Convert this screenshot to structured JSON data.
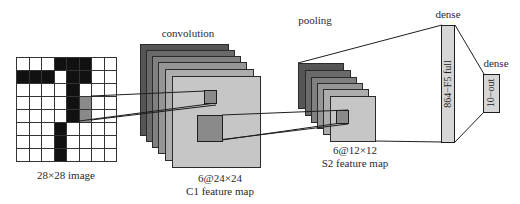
{
  "diagram": {
    "type": "CNN architecture",
    "input": {
      "label": "28×28 image",
      "grid": {
        "rows": 8,
        "cols": 8
      },
      "black_cells": [
        [
          0,
          3
        ],
        [
          0,
          4
        ],
        [
          0,
          5
        ],
        [
          1,
          0
        ],
        [
          1,
          1
        ],
        [
          1,
          2
        ],
        [
          1,
          4
        ],
        [
          1,
          5
        ],
        [
          2,
          4
        ],
        [
          3,
          4
        ],
        [
          4,
          4
        ],
        [
          5,
          3
        ],
        [
          6,
          3
        ],
        [
          7,
          3
        ]
      ],
      "highlight_cells": [
        [
          3,
          5
        ],
        [
          4,
          5
        ]
      ]
    },
    "convolution": {
      "title": "convolution",
      "caption_line1": "6@24×24",
      "caption_line2": "C1 feature map",
      "layers": 6
    },
    "pooling": {
      "title": "pooling",
      "caption_line1": "6@12×12",
      "caption_line2": "S2 feature map",
      "layers": 6
    },
    "dense1": {
      "title": "dense",
      "label": "864−F5 full"
    },
    "dense2": {
      "title": "dense",
      "label": "10−out"
    },
    "colors": {
      "layer_shades": [
        "#555555",
        "#6a6a6a",
        "#808080",
        "#969696",
        "#adadad",
        "#c6c6c6"
      ],
      "highlight": "#8a8a8a",
      "dense_fill": "#d6d6d6",
      "line": "#1e1e1e"
    }
  }
}
